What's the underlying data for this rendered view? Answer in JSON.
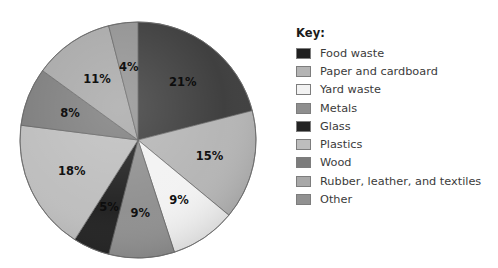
{
  "legend": {
    "title": "Key:",
    "items": [
      {
        "label": "Food waste",
        "color": "#1f1f1f"
      },
      {
        "label": "Paper and cardboard",
        "color": "#b4b4b4"
      },
      {
        "label": "Yard waste",
        "color": "#f2f2f2"
      },
      {
        "label": "Metals",
        "color": "#8e8e8e"
      },
      {
        "label": "Glass",
        "color": "#232323"
      },
      {
        "label": "Plastics",
        "color": "#bdbdbd"
      },
      {
        "label": "Wood",
        "color": "#7c7c7c"
      },
      {
        "label": "Rubber, leather, and textiles",
        "color": "#a8a8a8"
      },
      {
        "label": "Other",
        "color": "#919191"
      }
    ]
  },
  "chart_data": {
    "type": "pie",
    "title": "",
    "legend_position": "right",
    "grid": false,
    "units": "percent",
    "categories": [
      "Food waste",
      "Paper and cardboard",
      "Yard waste",
      "Metals",
      "Glass",
      "Plastics",
      "Wood",
      "Rubber, leather, and textiles",
      "Other"
    ],
    "values": [
      21,
      15,
      9,
      9,
      5,
      18,
      8,
      11,
      4
    ],
    "labels": [
      "21%",
      "15%",
      "9%",
      "9%",
      "5%",
      "18%",
      "8%",
      "11%",
      "4%"
    ],
    "colors": [
      "#3a3a3a",
      "#b4b4b4",
      "#f2f2f2",
      "#8e8e8e",
      "#1e1e1e",
      "#bdbdbd",
      "#7c7c7c",
      "#a8a8a8",
      "#919191"
    ],
    "start_angle_deg": 0,
    "direction": "clockwise",
    "center": {
      "x": 138,
      "y": 140
    },
    "radius": 118
  }
}
